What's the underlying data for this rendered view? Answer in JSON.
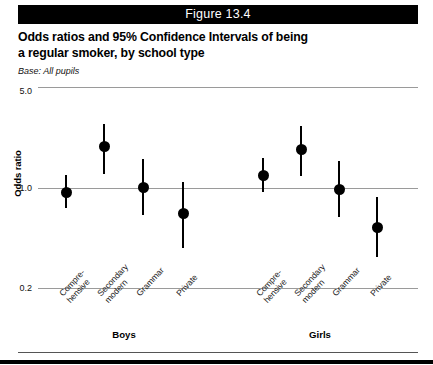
{
  "figure": {
    "banner_label": "Figure 13.4",
    "title_line1": "Odds ratios and 95% Confidence Intervals of being",
    "title_line2": "a regular smoker, by school type",
    "base_note": "Base: All pupils"
  },
  "chart_data": {
    "type": "scatter",
    "title": "Odds ratios and 95% Confidence Intervals of being a regular smoker, by school type",
    "subtitle": "Base: All pupils",
    "xlabel": "",
    "ylabel": "Odds ratio",
    "yscale": "log",
    "ylim": [
      0.2,
      5.0
    ],
    "ytick_labels": [
      "5.0",
      "1.0",
      "0.2"
    ],
    "ytick_values": [
      5.0,
      1.0,
      0.2
    ],
    "grid": true,
    "reference_line": 1.0,
    "legend": "none",
    "groups": [
      "Boys",
      "Girls"
    ],
    "categories": [
      "Compre-\nhensive",
      "Secondary\nmodern",
      "Grammar",
      "Private"
    ],
    "category_lines": [
      [
        "Compre-",
        "hensive"
      ],
      [
        "Secondary",
        "modern"
      ],
      [
        "Grammar",
        ""
      ],
      [
        "Private",
        ""
      ]
    ],
    "series": [
      {
        "name": "Boys",
        "points": [
          {
            "category": "Comprehensive",
            "estimate": 0.92,
            "ci_low": 0.72,
            "ci_high": 1.22
          },
          {
            "category": "Secondary modern",
            "estimate": 1.92,
            "ci_low": 1.25,
            "ci_high": 2.75
          },
          {
            "category": "Grammar",
            "estimate": 1.0,
            "ci_low": 0.64,
            "ci_high": 1.58
          },
          {
            "category": "Private",
            "estimate": 0.66,
            "ci_low": 0.38,
            "ci_high": 1.1
          }
        ]
      },
      {
        "name": "Girls",
        "points": [
          {
            "category": "Comprehensive",
            "estimate": 1.22,
            "ci_low": 0.93,
            "ci_high": 1.6
          },
          {
            "category": "Secondary modern",
            "estimate": 1.85,
            "ci_low": 1.2,
            "ci_high": 2.68
          },
          {
            "category": "Grammar",
            "estimate": 0.97,
            "ci_low": 0.62,
            "ci_high": 1.54
          },
          {
            "category": "Private",
            "estimate": 0.53,
            "ci_low": 0.33,
            "ci_high": 0.86
          }
        ]
      }
    ],
    "colors": {
      "marker": "#000000",
      "whisker": "#000000",
      "gridline": "#9a9a9a",
      "banner_background": "#000000",
      "banner_text": "#ffffff"
    }
  }
}
